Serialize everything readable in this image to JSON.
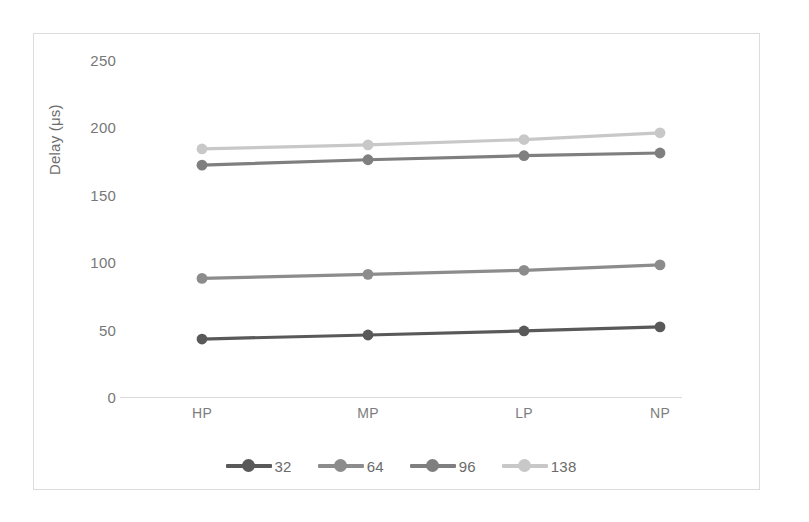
{
  "chart_data": {
    "type": "line",
    "title": "",
    "xlabel": "",
    "ylabel": "Delay (μs)",
    "categories": [
      "HP",
      "MP",
      "LP",
      "NP"
    ],
    "ylim": [
      0,
      250
    ],
    "yticks": [
      0,
      50,
      100,
      150,
      200,
      250
    ],
    "ytick_labels": [
      "0",
      "50",
      "100",
      "150",
      "200",
      "250"
    ],
    "grid": false,
    "legend_position": "bottom",
    "series": [
      {
        "name": "32",
        "color": "#595959",
        "values": [
          43,
          46,
          49,
          52
        ]
      },
      {
        "name": "64",
        "color": "#8c8c8c",
        "values": [
          88,
          91,
          94,
          98
        ]
      },
      {
        "name": "96",
        "color": "#7f7f7f",
        "values": [
          172,
          176,
          179,
          181
        ]
      },
      {
        "name": "138",
        "color": "#c8c8c8",
        "values": [
          184,
          187,
          191,
          196
        ]
      }
    ]
  },
  "axes": {
    "y_title": "Delay (μs)",
    "y_tick_labels": [
      "250",
      "200",
      "150",
      "100",
      "50",
      "0"
    ],
    "x_tick_labels": [
      "HP",
      "MP",
      "LP",
      "NP"
    ]
  },
  "legend": {
    "items": [
      {
        "label": "32"
      },
      {
        "label": "64"
      },
      {
        "label": "96"
      },
      {
        "label": "138"
      }
    ]
  },
  "colors": {
    "series_32": "#595959",
    "series_64": "#8c8c8c",
    "series_96": "#7f7f7f",
    "series_138": "#c8c8c8",
    "axis_line": "#d9d9d9",
    "tick_text": "#787878",
    "frame": "#dcdcdc",
    "background": "#ffffff"
  }
}
